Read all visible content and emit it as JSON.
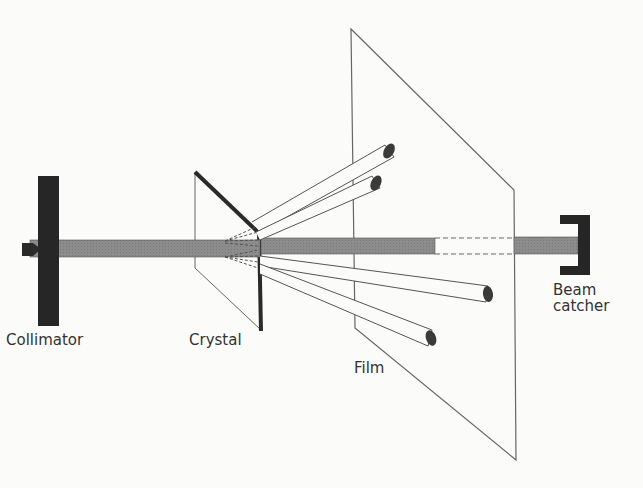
{
  "diagram": {
    "labels": {
      "collimator": "Collimator",
      "crystal": "Crystal",
      "film": "Film",
      "beam_catcher_line1": "Beam",
      "beam_catcher_line2": "catcher"
    },
    "components": [
      "collimator",
      "crystal",
      "film",
      "beam-catcher",
      "incident-beam",
      "diffracted-beams"
    ],
    "colors": {
      "beam": "#8a8a8a",
      "solid": "#2a2a2a",
      "line": "#555555",
      "background": "#fbfbf9"
    },
    "diffracted_beam_count": 4
  }
}
